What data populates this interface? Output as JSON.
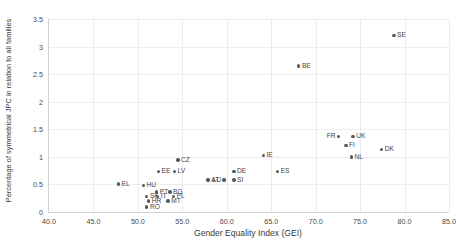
{
  "chart_data": {
    "type": "scatter",
    "title": "",
    "xlabel": "Gender Equality Index (GEI)",
    "ylabel": "Percentage of symmetrical JPC in relation to all families",
    "xlim": [
      40.0,
      85.0
    ],
    "ylim": [
      0,
      3.5
    ],
    "xticks": [
      "40.0",
      "45.0",
      "50.0",
      "55.0",
      "60.0",
      "65.0",
      "70.0",
      "75.0",
      "80.0",
      "85.0"
    ],
    "yticks": [
      "0",
      "0.5",
      "1",
      "1.5",
      "2",
      "2.5",
      "3",
      "3.5"
    ],
    "grid": true,
    "legend": null,
    "marker_color": "#58595b",
    "points": [
      {
        "label": "SE",
        "x": 78.8,
        "y": 3.2,
        "side": "right"
      },
      {
        "label": "BE",
        "x": 68.1,
        "y": 2.65,
        "side": "right"
      },
      {
        "label": "FR",
        "x": 72.6,
        "y": 1.37,
        "side": "left"
      },
      {
        "label": "UK",
        "x": 74.2,
        "y": 1.37,
        "side": "right"
      },
      {
        "label": "FI",
        "x": 73.4,
        "y": 1.21,
        "side": "right"
      },
      {
        "label": "DK",
        "x": 77.4,
        "y": 1.13,
        "side": "right"
      },
      {
        "label": "NL",
        "x": 74.0,
        "y": 1.0,
        "side": "right"
      },
      {
        "label": "IE",
        "x": 64.1,
        "y": 1.02,
        "side": "right"
      },
      {
        "label": "ES",
        "x": 65.7,
        "y": 0.73,
        "side": "right"
      },
      {
        "label": "CZ",
        "x": 54.5,
        "y": 0.94,
        "side": "right"
      },
      {
        "label": "EE",
        "x": 52.3,
        "y": 0.74,
        "side": "right"
      },
      {
        "label": "LV",
        "x": 54.1,
        "y": 0.74,
        "side": "right"
      },
      {
        "label": "DE",
        "x": 60.8,
        "y": 0.74,
        "side": "right"
      },
      {
        "label": "AT",
        "x": 57.9,
        "y": 0.58,
        "side": "right"
      },
      {
        "label": "LU",
        "x": 59.7,
        "y": 0.58,
        "side": "left"
      },
      {
        "label": "SI",
        "x": 60.8,
        "y": 0.58,
        "side": "right"
      },
      {
        "label": "EL",
        "x": 47.8,
        "y": 0.51,
        "side": "right"
      },
      {
        "label": "HU",
        "x": 50.6,
        "y": 0.48,
        "side": "right"
      },
      {
        "label": "PT",
        "x": 52.1,
        "y": 0.36,
        "side": "right"
      },
      {
        "label": "BG",
        "x": 53.6,
        "y": 0.36,
        "side": "right"
      },
      {
        "label": "SK",
        "x": 51.0,
        "y": 0.28,
        "side": "right"
      },
      {
        "label": "IT",
        "x": 52.2,
        "y": 0.28,
        "side": "right"
      },
      {
        "label": "PL",
        "x": 54.0,
        "y": 0.28,
        "side": "right"
      },
      {
        "label": "HR",
        "x": 51.2,
        "y": 0.2,
        "side": "right"
      },
      {
        "label": "MT",
        "x": 53.4,
        "y": 0.2,
        "side": "right"
      },
      {
        "label": "RO",
        "x": 51.0,
        "y": 0.09,
        "side": "right"
      }
    ]
  }
}
